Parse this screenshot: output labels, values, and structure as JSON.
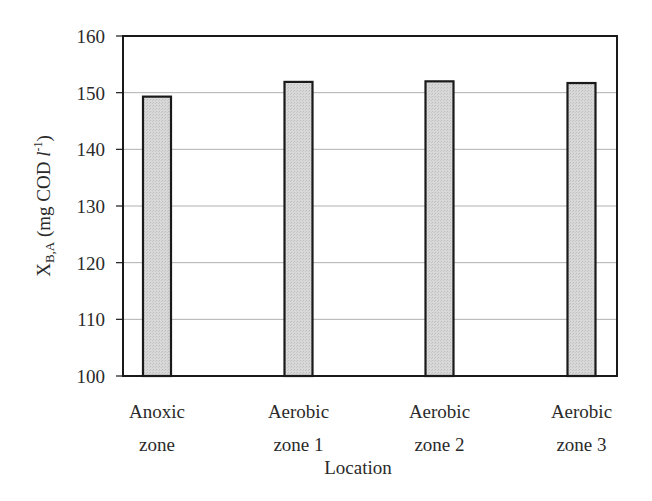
{
  "chart_data": {
    "type": "bar",
    "title": "",
    "xlabel": "Location",
    "ylabel": "X_B,A (mg COD l^-1)",
    "ylabel_parts": {
      "main": "X",
      "sub": "B,A",
      "unit_pre": " (mg COD ",
      "unit_l": "l",
      "unit_exp": "-1",
      "unit_post": ")"
    },
    "categories": [
      "Anoxic zone",
      "Aerobic zone 1",
      "Aerobic zone 2",
      "Aerobic zone 3"
    ],
    "category_lines": [
      [
        "Anoxic",
        "zone"
      ],
      [
        "Aerobic",
        "zone 1"
      ],
      [
        "Aerobic",
        "zone 2"
      ],
      [
        "Aerobic",
        "zone 3"
      ]
    ],
    "values": [
      149.3,
      151.9,
      152.0,
      151.7
    ],
    "ylim": [
      100,
      160
    ],
    "yticks": [
      100,
      110,
      120,
      130,
      140,
      150,
      160
    ],
    "grid": true,
    "legend": null,
    "colors": {
      "bar_fill": "#d4d4d4",
      "bar_stroke": "#1a1a1a",
      "grid": "#b0b0b0",
      "frame": "#1a1a1a"
    }
  }
}
